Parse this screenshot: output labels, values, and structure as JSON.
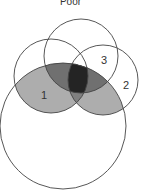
{
  "title": "Poor",
  "labels": {
    "one": "1",
    "two": "2",
    "three": "3"
  },
  "colors": {
    "stroke": "#333333",
    "light_shade": "#a8a8a8",
    "mid_shade": "#6a6a6a",
    "dark_shade": "#222222",
    "background": "#ffffff"
  }
}
